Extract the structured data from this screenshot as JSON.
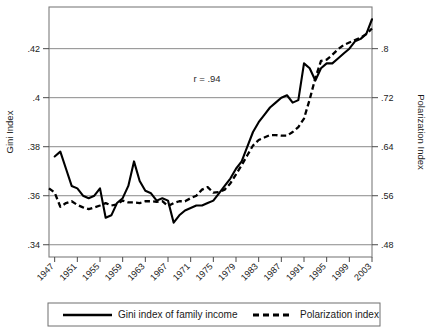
{
  "chart_data": {
    "type": "line",
    "title": "",
    "xlabel": "",
    "ylabel": "Gini Index",
    "y2label": "Polarization Index",
    "grid": true,
    "legend_position": "bottom",
    "annotation": "r = .94",
    "xlim": [
      1946,
      2003
    ],
    "ylim": [
      0.335,
      0.437
    ],
    "y2lim": [
      0.46,
      0.868
    ],
    "yticks": [
      ".34",
      ".36",
      ".38",
      ".4",
      ".42"
    ],
    "ytick_values": [
      0.34,
      0.36,
      0.38,
      0.4,
      0.42
    ],
    "y2ticks": [
      ".48",
      ".56",
      ".64",
      ".72",
      ".8"
    ],
    "y2tick_values": [
      0.48,
      0.56,
      0.64,
      0.72,
      0.8
    ],
    "xticks": [
      "1947",
      "1951",
      "1955",
      "1959",
      "1963",
      "1967",
      "1971",
      "1975",
      "1979",
      "1983",
      "1987",
      "1991",
      "1995",
      "1999",
      "2003"
    ],
    "x": [
      1946,
      1947,
      1948,
      1949,
      1950,
      1951,
      1952,
      1953,
      1954,
      1955,
      1956,
      1957,
      1958,
      1959,
      1960,
      1961,
      1962,
      1963,
      1964,
      1965,
      1966,
      1967,
      1968,
      1969,
      1970,
      1971,
      1972,
      1973,
      1974,
      1975,
      1976,
      1977,
      1978,
      1979,
      1980,
      1981,
      1982,
      1983,
      1984,
      1985,
      1986,
      1987,
      1988,
      1989,
      1990,
      1991,
      1992,
      1993,
      1994,
      1995,
      1996,
      1997,
      1998,
      1999,
      2000,
      2001,
      2002,
      2003
    ],
    "series": [
      {
        "name": "Gini index of family income",
        "style": "solid",
        "axis": "left",
        "values": [
          null,
          0.376,
          0.378,
          0.371,
          0.364,
          0.363,
          0.36,
          0.359,
          0.36,
          0.363,
          0.351,
          0.352,
          0.357,
          0.359,
          0.364,
          0.374,
          0.366,
          0.362,
          0.361,
          0.358,
          0.359,
          0.358,
          0.349,
          0.352,
          0.354,
          0.355,
          0.356,
          0.356,
          0.357,
          0.358,
          0.361,
          0.364,
          0.367,
          0.371,
          0.374,
          0.38,
          0.386,
          0.39,
          0.393,
          0.396,
          0.398,
          0.4,
          0.401,
          0.398,
          0.399,
          0.414,
          0.412,
          0.407,
          0.412,
          0.414,
          0.414,
          0.416,
          0.418,
          0.42,
          0.423,
          0.424,
          0.426,
          0.432
        ]
      },
      {
        "name": "Polarization index",
        "style": "dashed",
        "axis": "right",
        "values": [
          0.572,
          0.565,
          0.542,
          0.548,
          0.551,
          0.545,
          0.541,
          0.538,
          0.541,
          0.544,
          0.548,
          0.544,
          0.546,
          0.552,
          0.549,
          0.549,
          0.548,
          0.551,
          0.551,
          0.55,
          0.551,
          0.543,
          0.548,
          0.551,
          0.551,
          0.556,
          0.56,
          0.57,
          0.574,
          0.565,
          0.566,
          0.57,
          0.58,
          0.595,
          0.61,
          0.626,
          0.642,
          0.651,
          0.655,
          0.659,
          0.659,
          0.658,
          0.658,
          0.664,
          0.672,
          0.686,
          0.717,
          0.752,
          0.78,
          0.782,
          0.79,
          0.799,
          0.806,
          0.81,
          0.814,
          0.818,
          0.824,
          0.833
        ]
      }
    ]
  },
  "legend": {
    "entries": [
      {
        "label": "Gini index of family income",
        "style": "solid"
      },
      {
        "label": "Polarization index",
        "style": "dashed"
      }
    ]
  },
  "axes": {
    "left_title": "Gini Index",
    "right_title": "Polarization Index"
  },
  "annotation": {
    "text": "r = .94"
  }
}
